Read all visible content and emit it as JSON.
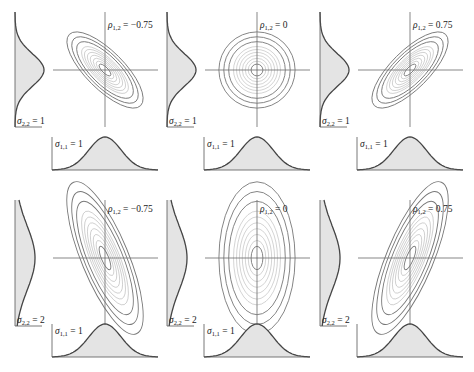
{
  "chart_data": {
    "type": "contour",
    "layout": {
      "rows": 2,
      "cols": 3,
      "grid": false,
      "legend": "none"
    },
    "panels": [
      {
        "row": 0,
        "col": 0,
        "rho": -0.75,
        "sigma11": 1,
        "sigma22": 1,
        "rho_label": "−0.75",
        "sigma11_label": "1",
        "sigma22_label": "1",
        "show_sigma11": true,
        "show_sigma22": true
      },
      {
        "row": 0,
        "col": 1,
        "rho": 0,
        "sigma11": 1,
        "sigma22": 1,
        "rho_label": "0",
        "sigma11_label": "1",
        "sigma22_label": "1",
        "show_sigma11": true,
        "show_sigma22": true
      },
      {
        "row": 0,
        "col": 2,
        "rho": 0.75,
        "sigma11": 1,
        "sigma22": 1,
        "rho_label": "0.75",
        "sigma11_label": "1",
        "sigma22_label": "1",
        "show_sigma11": true,
        "show_sigma22": true
      },
      {
        "row": 1,
        "col": 0,
        "rho": -0.75,
        "sigma11": 1,
        "sigma22": 2,
        "rho_label": "−0.75",
        "sigma11_label": "1",
        "sigma22_label": "2",
        "show_sigma11": true,
        "show_sigma22": true
      },
      {
        "row": 1,
        "col": 1,
        "rho": 0,
        "sigma11": 1,
        "sigma22": 2,
        "rho_label": "0",
        "sigma11_label": "1",
        "sigma22_label": "2",
        "show_sigma11": true,
        "show_sigma22": true
      },
      {
        "row": 1,
        "col": 2,
        "rho": 0.75,
        "sigma11": 1,
        "sigma22": 2,
        "rho_label": "0.75",
        "sigma11_label": "1",
        "sigma22_label": "2",
        "show_sigma11": false,
        "show_sigma22": true
      }
    ],
    "annotations": {
      "rho_symbol": "ρ",
      "rho_subscript": "1,2",
      "sigma_symbol": "σ",
      "sigma11_subscript": "1,1",
      "sigma22_subscript": "2,2",
      "equals": " = "
    }
  },
  "colors": {
    "curve": "#444444",
    "fill": "#e4e4e4",
    "axis": "#555555",
    "contour": "#777777"
  }
}
